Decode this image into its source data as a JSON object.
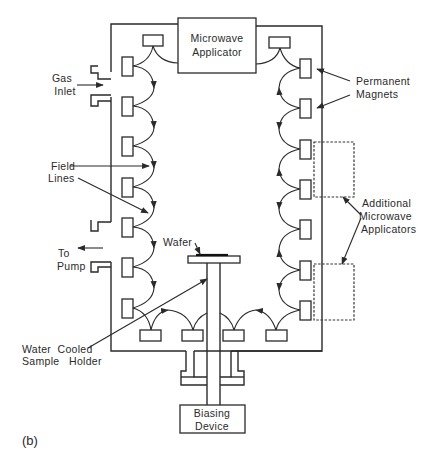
{
  "figure": {
    "panel_label": "(b)",
    "colors": {
      "line": "#2a2a2a",
      "background": "#ffffff"
    }
  },
  "labels": {
    "microwave_applicator": [
      "Microwave",
      "Applicator"
    ],
    "gas_inlet": [
      "Gas",
      "Inlet"
    ],
    "field_lines": [
      "Field",
      "Lines"
    ],
    "to_pump": [
      "To",
      "Pump"
    ],
    "wafer": "Wafer",
    "water_cooled_sample_holder": [
      "Water  Cooled",
      "Sample   Holder"
    ],
    "biasing_device": [
      "Biasing",
      "Device"
    ],
    "permanent_magnets": [
      "Permanent",
      "Magnets"
    ],
    "additional_microwave_applicators": [
      "Additional",
      "Microwave",
      "Applicators"
    ]
  },
  "components": {
    "left_magnets_count": 7,
    "right_magnets_count": 7,
    "top_magnets_count": 2,
    "bottom_magnets_count": 4,
    "additional_applicators_count": 2
  }
}
